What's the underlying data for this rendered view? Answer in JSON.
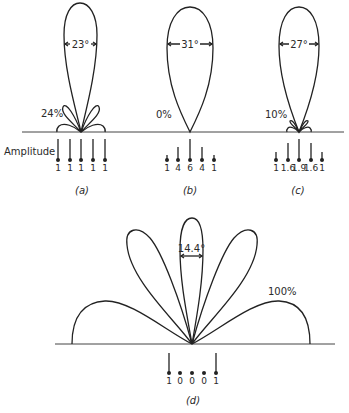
{
  "figure": {
    "amplitude_label": "Amplitude",
    "panels": [
      {
        "id": "a",
        "caption": "(a)",
        "beamwidth_label": "23°",
        "sidelobe_label": "24%",
        "amplitudes": [
          "1",
          "1",
          "1",
          "1",
          "1"
        ]
      },
      {
        "id": "b",
        "caption": "(b)",
        "beamwidth_label": "31°",
        "sidelobe_label": "0%",
        "amplitudes": [
          "1",
          "4",
          "6",
          "4",
          "1"
        ]
      },
      {
        "id": "c",
        "caption": "(c)",
        "beamwidth_label": "27°",
        "sidelobe_label": "10%",
        "amplitudes": [
          "1",
          "1.6",
          "1.9",
          "1.6",
          "1"
        ]
      },
      {
        "id": "d",
        "caption": "(d)",
        "beamwidth_label": "14.4°",
        "sidelobe_label": "100%",
        "amplitudes": [
          "1",
          "0",
          "0",
          "0",
          "1"
        ]
      }
    ]
  }
}
